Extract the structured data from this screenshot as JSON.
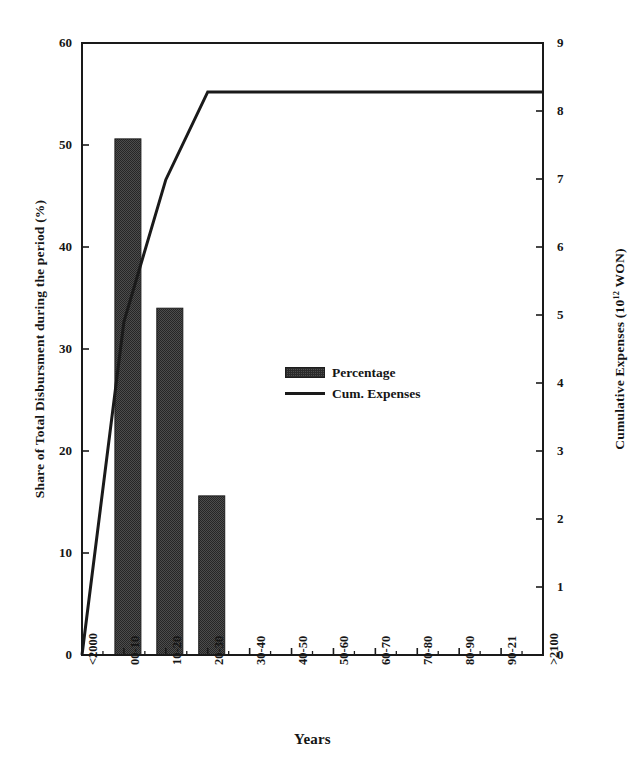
{
  "chart_data": {
    "type": "bar",
    "title": "",
    "xlabel": "Years",
    "ylabel": "Share of Total Disbursment during the period (%)",
    "ylabel_right": "Cumulative Expenses (10¹² WON)",
    "ylabel_right_base": "Cumulative Expenses (10",
    "ylabel_right_exp": "12",
    "ylabel_right_tail": " WON)",
    "categories": [
      "<2000",
      "00-10",
      "10-20",
      "20-30",
      "30-40",
      "40-50",
      "50-60",
      "60-70",
      "70-80",
      "80-90",
      "90-21",
      ">2100"
    ],
    "ylim": [
      0,
      60
    ],
    "yticks": [
      0,
      10,
      20,
      30,
      40,
      50,
      60
    ],
    "ylim_right": [
      0,
      9
    ],
    "yticks_right": [
      0,
      1,
      2,
      3,
      4,
      5,
      6,
      7,
      8,
      9
    ],
    "grid": false,
    "legend_position": "center",
    "series": [
      {
        "name": "Percentage",
        "type": "bar",
        "axis": "left",
        "units": "%",
        "values": [
          0,
          50.6,
          34.0,
          15.6,
          0,
          0,
          0,
          0,
          0,
          0,
          0,
          0
        ]
      },
      {
        "name": "Cum. Expenses",
        "type": "line",
        "axis": "right",
        "units": "10^12 WON",
        "values": [
          0.0,
          4.9,
          6.99,
          8.28,
          8.28,
          8.28,
          8.28,
          8.28,
          8.28,
          8.28,
          8.28,
          8.28
        ]
      }
    ]
  },
  "legend": {
    "items": [
      {
        "label": "Percentage",
        "marker": "bar-swatch"
      },
      {
        "label": "Cum. Expenses",
        "marker": "line-swatch"
      }
    ]
  },
  "colors": {
    "bar_fill": "#4d4d4d",
    "bar_hatch": "#2b2b2b",
    "bar_edge": "#1d1d1d",
    "line": "#1a1a1a",
    "axis": "#1a1a1a",
    "background": "#ffffff"
  }
}
